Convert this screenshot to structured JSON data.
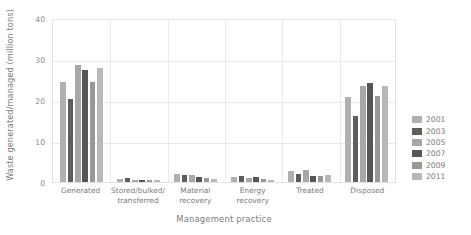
{
  "chart_data": {
    "type": "bar",
    "title": "",
    "xlabel": "Management practice",
    "ylabel": "Waste generated/managed (million tons)",
    "ylim": [
      0,
      40
    ],
    "yticks": [
      0,
      10,
      20,
      30,
      40
    ],
    "ytick_labels": [
      "0",
      "10",
      "20",
      "30",
      "40"
    ],
    "grid": "horizontal-and-vertical",
    "legend_position": "right",
    "categories": [
      "Generated",
      "Stored/bulked/\ntransferred",
      "Material\nrecovery",
      "Energy\nrecovery",
      "Treated",
      "Disposed"
    ],
    "series": [
      {
        "name": "2001",
        "color": "#b0b0b0",
        "values": [
          24.5,
          0.7,
          1.9,
          1.2,
          2.6,
          20.7
        ]
      },
      {
        "name": "2003",
        "color": "#5e5e5e",
        "values": [
          20.2,
          0.9,
          1.8,
          1.4,
          2.0,
          16.2
        ]
      },
      {
        "name": "2005",
        "color": "#a8a8a8",
        "values": [
          28.6,
          0.6,
          1.6,
          1.1,
          2.9,
          23.3
        ]
      },
      {
        "name": "2007",
        "color": "#565656",
        "values": [
          27.4,
          0.5,
          1.2,
          1.3,
          1.5,
          24.2
        ]
      },
      {
        "name": "2009",
        "color": "#989898",
        "values": [
          24.5,
          0.4,
          0.9,
          0.7,
          1.4,
          21.0
        ]
      },
      {
        "name": "2011",
        "color": "#b8b8b8",
        "values": [
          27.9,
          0.4,
          0.8,
          0.6,
          1.6,
          23.4
        ]
      }
    ]
  },
  "legend": {
    "items": [
      {
        "label": "2001"
      },
      {
        "label": "2003"
      },
      {
        "label": "2005"
      },
      {
        "label": "2007"
      },
      {
        "label": "2009"
      },
      {
        "label": "2011"
      }
    ]
  }
}
